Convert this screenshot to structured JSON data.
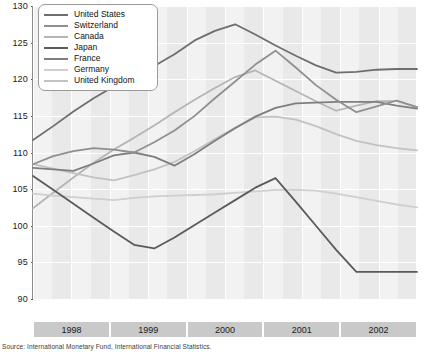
{
  "chart_data": {
    "type": "line",
    "title": "",
    "xlabel": "",
    "ylabel": "",
    "ylim": [
      90,
      130
    ],
    "yticks": [
      90,
      95,
      100,
      105,
      110,
      115,
      120,
      125,
      130
    ],
    "grid": true,
    "legend_position": "top-left",
    "x": [
      "1998Q1",
      "1998Q2",
      "1998Q3",
      "1998Q4",
      "1999Q1",
      "1999Q2",
      "1999Q3",
      "1999Q4",
      "2000Q1",
      "2000Q2",
      "2000Q3",
      "2000Q4",
      "2001Q1",
      "2001Q2",
      "2001Q3",
      "2001Q4",
      "2002Q1",
      "2002Q2",
      "2002Q3",
      "2002Q4"
    ],
    "year_bands": [
      "1998",
      "1999",
      "2000",
      "2001",
      "2002"
    ],
    "series": [
      {
        "name": "United States",
        "color": "#6e6e6e",
        "values": [
          111.7,
          113.6,
          115.6,
          117.4,
          119.0,
          120.3,
          121.8,
          123.4,
          125.3,
          126.6,
          127.5,
          126.1,
          124.6,
          123.2,
          121.9,
          120.9,
          121.0,
          121.3,
          121.4,
          121.4
        ]
      },
      {
        "name": "Switzerland",
        "color": "#8f8f8f",
        "values": [
          108.4,
          109.5,
          110.2,
          110.6,
          110.4,
          110.0,
          111.4,
          113.0,
          115.0,
          117.4,
          119.7,
          122.0,
          123.9,
          121.6,
          119.2,
          117.2,
          115.5,
          116.3,
          117.1,
          116.2
        ]
      },
      {
        "name": "Canada",
        "color": "#b5b5b5",
        "values": [
          102.4,
          104.5,
          106.6,
          108.6,
          110.4,
          112.0,
          113.7,
          115.5,
          117.2,
          118.8,
          120.3,
          121.2,
          119.8,
          118.4,
          117.0,
          115.7,
          116.4,
          117.0,
          117.0,
          116.2
        ]
      },
      {
        "name": "Japan",
        "color": "#5a5a5a",
        "values": [
          106.8,
          104.9,
          103.0,
          101.1,
          99.2,
          97.4,
          96.9,
          98.4,
          100.1,
          101.8,
          103.5,
          105.2,
          106.5,
          103.3,
          100.0,
          96.7,
          93.7,
          93.7,
          93.7,
          93.7
        ]
      },
      {
        "name": "France",
        "color": "#7e7e7e",
        "values": [
          107.9,
          107.7,
          107.5,
          108.5,
          109.6,
          110.0,
          109.4,
          108.2,
          109.8,
          111.6,
          113.3,
          114.9,
          116.1,
          116.7,
          116.8,
          116.9,
          116.9,
          116.9,
          116.4,
          116.0
        ]
      },
      {
        "name": "Germany",
        "color": "#cfcfcf",
        "values": [
          104.4,
          104.1,
          103.9,
          103.7,
          103.5,
          103.8,
          104.0,
          104.1,
          104.2,
          104.3,
          104.5,
          104.7,
          104.9,
          104.9,
          104.8,
          104.4,
          103.9,
          103.4,
          102.9,
          102.5
        ]
      },
      {
        "name": "United Kingdom",
        "color": "#c2c2c2",
        "values": [
          108.4,
          107.8,
          107.2,
          106.6,
          106.2,
          106.9,
          107.7,
          108.7,
          110.2,
          111.8,
          113.4,
          114.8,
          114.9,
          114.5,
          113.6,
          112.5,
          111.6,
          111.0,
          110.6,
          110.3
        ]
      }
    ]
  },
  "legend": {
    "items": [
      {
        "label": "United States"
      },
      {
        "label": "Switzerland"
      },
      {
        "label": "Canada"
      },
      {
        "label": "Japan"
      },
      {
        "label": "France"
      },
      {
        "label": "Germany"
      },
      {
        "label": "United Kingdom"
      }
    ]
  },
  "source": {
    "text": "Source: International Monetary Fund, International Financial Statistics."
  }
}
